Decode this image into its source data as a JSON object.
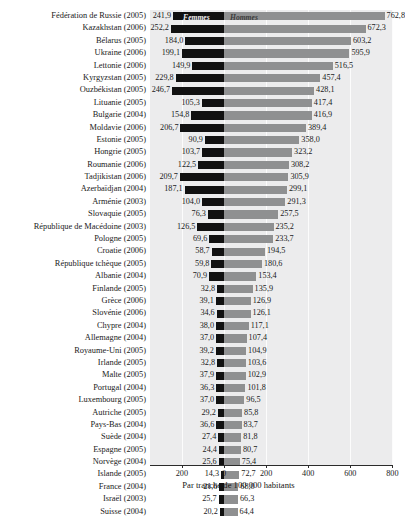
{
  "chart_data": {
    "type": "bar",
    "orientation": "horizontal",
    "style": "diverging-bidirectional",
    "title": "",
    "subtitle": "",
    "xlabel": "Par tranche de 100 000 habitants",
    "ylabel": "",
    "xlim": [
      -300,
      900
    ],
    "xticks": [
      -200,
      0,
      200,
      400,
      600,
      800
    ],
    "xticklabels": [
      "200",
      "0",
      "200",
      "400",
      "600",
      "800"
    ],
    "grid": true,
    "grid_axis": "x",
    "legend": [
      "Femmes",
      "Hommes"
    ],
    "legend_position": "top-center-inside",
    "series": [
      {
        "name": "Femmes",
        "color": "#111111",
        "direction": "left"
      },
      {
        "name": "Hommes",
        "color": "#8f9091",
        "direction": "right"
      }
    ],
    "categories": [
      "Fédération de Russie (2005)",
      "Kazakhstan (2006)",
      "Bélarus (2005)",
      "Ukraine (2006)",
      "Lettonie (2006)",
      "Kyrgyzstan (2005)",
      "Ouzbékistan (2005)",
      "Lituanie (2005)",
      "Bulgarie (2004)",
      "Moldavie (2006)",
      "Estonie (2005)",
      "Hongrie (2005)",
      "Roumanie (2006)",
      "Tadjikistan (2006)",
      "Azerbaïdjan (2004)",
      "Arménie (2003)",
      "Slovaquie (2005)",
      "République de Macédoine (2003)",
      "Pologne (2005)",
      "Croatie (2006)",
      "République tchèque (2005)",
      "Albanie (2004)",
      "Finlande (2005)",
      "Grèce (2006)",
      "Slovénie (2006)",
      "Chypre (2004)",
      "Allemagne (2004)",
      "Royaume-Uni (2005)",
      "Irlande (2005)",
      "Malte (2005)",
      "Portugal (2004)",
      "Luxembourg (2005)",
      "Autriche (2005)",
      "Pays-Bas (2004)",
      "Suède (2004)",
      "Espagne (2005)",
      "Norvège (2004)",
      "Islande (2005)",
      "France (2004)",
      "Israël (2003)",
      "Suisse (2004)"
    ],
    "femmes": [
      241.9,
      252.2,
      184.0,
      199.1,
      149.9,
      229.8,
      246.7,
      105.3,
      154.8,
      206.7,
      90.9,
      103.7,
      122.5,
      209.7,
      187.1,
      104.0,
      76.3,
      126.5,
      69.6,
      58.7,
      59.8,
      70.9,
      32.8,
      39.1,
      34.6,
      38.0,
      37.0,
      39.2,
      32.8,
      37.9,
      36.3,
      37.0,
      29.2,
      36.6,
      27.4,
      24.4,
      25.6,
      14.3,
      21.6,
      25.7,
      20.2
    ],
    "hommes": [
      762.8,
      672.3,
      603.2,
      595.9,
      516.5,
      457.4,
      428.1,
      417.4,
      416.9,
      389.4,
      358.0,
      323.2,
      308.2,
      305.9,
      299.1,
      291.3,
      257.5,
      235.2,
      233.7,
      194.5,
      180.6,
      153.4,
      135.9,
      126.9,
      126.1,
      117.1,
      107.4,
      104.9,
      103.6,
      102.9,
      101.8,
      96.5,
      85.8,
      83.7,
      81.8,
      80.7,
      75.4,
      72.7,
      68.0,
      66.3,
      64.4
    ],
    "femmes_labels": [
      "241,9",
      "252,2",
      "184,0",
      "199,1",
      "149,9",
      "229,8",
      "246,7",
      "105,3",
      "154,8",
      "206,7",
      "90,9",
      "103,7",
      "122,5",
      "209,7",
      "187,1",
      "104,0",
      "76,3",
      "126,5",
      "69,6",
      "58,7",
      "59,8",
      "70,9",
      "32,8",
      "39,1",
      "34,6",
      "38,0",
      "37,0",
      "39,2",
      "32,8",
      "37,9",
      "36,3",
      "37,0",
      "29,2",
      "36,6",
      "27,4",
      "24,4",
      "25,6",
      "14,3",
      "21,6",
      "25,7",
      "20,2"
    ],
    "hommes_labels": [
      "762,8",
      "672,3",
      "603,2",
      "595,9",
      "516,5",
      "457,4",
      "428,1",
      "417,4",
      "416,9",
      "389,4",
      "358,0",
      "323,2",
      "308,2",
      "305,9",
      "299,1",
      "291,3",
      "257,5",
      "235,2",
      "233,7",
      "194,5",
      "180,6",
      "153,4",
      "135,9",
      "126,9",
      "126,1",
      "117,1",
      "107,4",
      "104,9",
      "103,6",
      "102,9",
      "101,8",
      "96,5",
      "85,8",
      "83,7",
      "81,8",
      "80,7",
      "75,4",
      "72,7",
      "68,0",
      "66,3",
      "64,4"
    ]
  },
  "colors": {
    "femmes_bar": "#111111",
    "hommes_bar": "#8f9091",
    "plot_background": "#ececed",
    "gridline": "#fcfcfc",
    "axis": "#2b2b2b",
    "text": "#1a1a1a",
    "page_background": "#ffffff"
  }
}
